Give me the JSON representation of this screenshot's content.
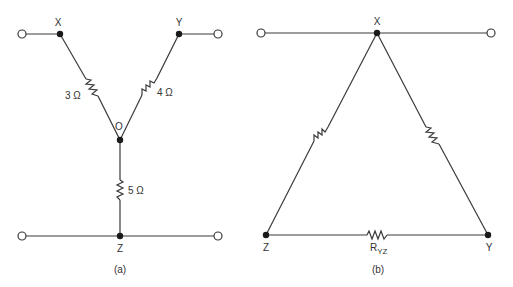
{
  "diagram_a": {
    "caption": "(a)",
    "nodes": {
      "x": "X",
      "y": "Y",
      "o": "O",
      "z": "Z"
    },
    "resistors": {
      "xo": "3 Ω",
      "yo": "4 Ω",
      "oz": "5 Ω"
    }
  },
  "diagram_b": {
    "caption": "(b)",
    "nodes": {
      "x": "X",
      "y": "Y",
      "z": "Z"
    },
    "resistors": {
      "yz_main": "R",
      "yz_sub": "YZ"
    }
  },
  "colors": {
    "line": "#3a3a3a",
    "dot": "#1a1a1a",
    "background": "#ffffff"
  }
}
